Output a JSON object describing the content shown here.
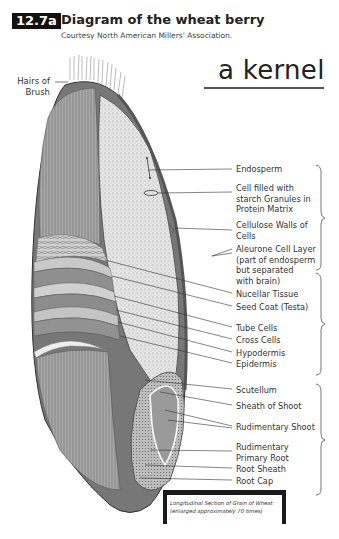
{
  "header": {
    "figure_number": "12.7a",
    "title": "Diagram of the wheat berry",
    "credit": "Courtesy North American Millers' Association."
  },
  "annotation": {
    "handwritten_title": "a kernel"
  },
  "left_label": {
    "text": "Hairs of\nBrush"
  },
  "labels": [
    {
      "id": "endosperm",
      "text": "Endosperm",
      "top": 164
    },
    {
      "id": "starch-cell",
      "text": "Cell filled with\nstarch Granules in\nProtein Matrix",
      "top": 183
    },
    {
      "id": "cellulose-walls",
      "text": "Cellulose Walls of\nCells",
      "top": 220
    },
    {
      "id": "aleurone",
      "text": "Aleurone Cell Layer\n(part of endosperm\nbut separated\nwith brain)",
      "top": 244
    },
    {
      "id": "nucellar",
      "text": "Nucellar Tissue",
      "top": 289
    },
    {
      "id": "seed-coat",
      "text": "Seed Coat (Testa)",
      "top": 302
    },
    {
      "id": "tube-cells",
      "text": "Tube Cells",
      "top": 323
    },
    {
      "id": "cross-cells",
      "text": "Cross Cells",
      "top": 335
    },
    {
      "id": "hypodermis",
      "text": "Hypodermis",
      "top": 348
    },
    {
      "id": "epidermis",
      "text": "Epidermis",
      "top": 359
    },
    {
      "id": "scutellum",
      "text": "Scutellum",
      "top": 385
    },
    {
      "id": "sheath-shoot",
      "text": "Sheath of Shoot",
      "top": 401
    },
    {
      "id": "rudimentary-shoot",
      "text": "Rudimentary Shoot",
      "top": 422
    },
    {
      "id": "primary-root",
      "text": "Rudimentary\nPrimary Root",
      "top": 442
    },
    {
      "id": "root-sheath",
      "text": "Root Sheath",
      "top": 464
    },
    {
      "id": "root-cap",
      "text": "Root Cap",
      "top": 476
    }
  ],
  "groups": [
    {
      "name": "endosperm-group",
      "top": 165,
      "bottom": 270
    },
    {
      "name": "bran-group",
      "top": 273,
      "bottom": 375
    },
    {
      "name": "germ-group",
      "top": 384,
      "bottom": 495
    }
  ],
  "caption": {
    "line1": "Longitudinal Section of Grain of Wheat",
    "line2": "(enlarged approximately 70 times)"
  }
}
